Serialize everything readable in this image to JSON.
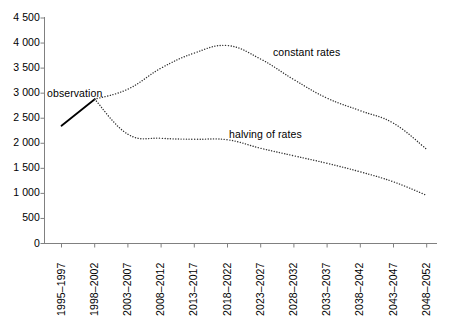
{
  "chart_data": {
    "type": "line",
    "title": "",
    "subtitle": "",
    "xlabel": "",
    "ylabel": "",
    "ylim": [
      0,
      4500
    ],
    "ytick_step": 500,
    "grid": false,
    "legend_position": "inline-annotations",
    "categories": [
      "1995–1997",
      "1998–2002",
      "2003–2007",
      "2008–2012",
      "2013–2017",
      "2018–2022",
      "2023–2027",
      "2028–2032",
      "2033–2037",
      "2038–2042",
      "2043–2047",
      "2048–2052"
    ],
    "ytick_labels": [
      "0",
      "500",
      "1 000",
      "1 500",
      "2 000",
      "2 500",
      "3 000",
      "3 500",
      "4 000",
      "4 500"
    ],
    "ytick_values": [
      0,
      500,
      1000,
      1500,
      2000,
      2500,
      3000,
      3500,
      4000,
      4500
    ],
    "series": [
      {
        "name": "observation",
        "style": "solid",
        "color": "#000000",
        "values": [
          2350,
          2880,
          null,
          null,
          null,
          null,
          null,
          null,
          null,
          null,
          null,
          null
        ]
      },
      {
        "name": "constant rates",
        "style": "dotted",
        "color": "#333333",
        "values": [
          null,
          2880,
          3080,
          3500,
          3800,
          3950,
          3680,
          3270,
          2900,
          2650,
          2400,
          1880
        ]
      },
      {
        "name": "halving of rates",
        "style": "dotted",
        "color": "#333333",
        "values": [
          null,
          2880,
          2180,
          2100,
          2080,
          2070,
          1900,
          1750,
          1600,
          1430,
          1230,
          960
        ]
      }
    ],
    "annotations": [
      {
        "text": "observation",
        "x_px": 47,
        "y_px": 88
      },
      {
        "text": "constant rates",
        "x_px": 273,
        "y_px": 47
      },
      {
        "text": "halving of rates",
        "x_px": 229,
        "y_px": 129
      }
    ]
  },
  "axis": {
    "y_axis_color": "#808080",
    "x_axis_color": "#808080"
  }
}
